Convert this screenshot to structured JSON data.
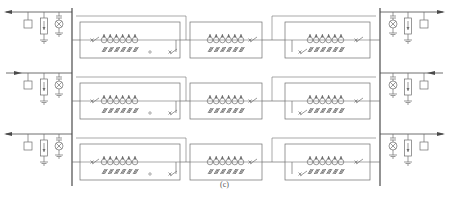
{
  "caption": "(c)",
  "colors": {
    "line": "#6e6e6e",
    "bus": "#4a4a4a",
    "background": "#ffffff"
  },
  "layout": {
    "rows": [
      {
        "bus_y": 12,
        "feeder_y": 40,
        "box_top": 22,
        "box_bottom": 58,
        "left_arrow": "left",
        "right_arrow": "right"
      },
      {
        "bus_y": 73,
        "feeder_y": 101,
        "box_top": 83,
        "box_bottom": 119,
        "left_arrow": "right",
        "right_arrow": "left"
      },
      {
        "bus_y": 134,
        "feeder_y": 162,
        "box_top": 144,
        "box_bottom": 180,
        "left_arrow": "left",
        "right_arrow": "right"
      }
    ],
    "left_bus_x": 72,
    "right_bus_x": 380,
    "modules": [
      {
        "name": "left-module",
        "x1": 80,
        "x2": 180,
        "lamps": 6,
        "has_left_breaker": true,
        "has_right_breaker": true
      },
      {
        "name": "middle-module",
        "x1": 190,
        "x2": 262,
        "lamps": 6,
        "has_left_breaker": false,
        "has_right_breaker": true
      },
      {
        "name": "right-module",
        "x1": 285,
        "x2": 370,
        "lamps": 6,
        "has_left_breaker": true,
        "has_right_breaker": true
      }
    ]
  },
  "legend_symbols": [
    "load-box",
    "fuse-resistor",
    "lamp-indicator",
    "ground",
    "breaker-switch",
    "capacitor-bank"
  ]
}
